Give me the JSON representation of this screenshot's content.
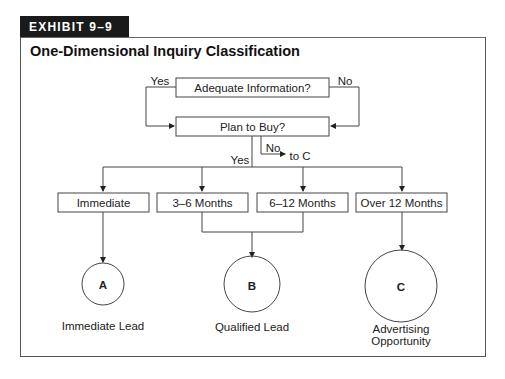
{
  "exhibit": {
    "label": "EXHIBIT 9–9"
  },
  "title": "One-Dimensional Inquiry Classification",
  "nodes": {
    "adequate_info": "Adequate Information?",
    "plan_to_buy": "Plan to Buy?",
    "immediate": "Immediate",
    "months_3_6": "3–6 Months",
    "months_6_12": "6–12 Months",
    "over_12": "Over 12 Months"
  },
  "edges": {
    "adequate_yes": "Yes",
    "adequate_no": "No",
    "plan_no": "No",
    "plan_no_target": "to C",
    "plan_yes": "Yes"
  },
  "outcomes": [
    {
      "letter": "A",
      "label": "Immediate Lead"
    },
    {
      "letter": "B",
      "label": "Qualified Lead"
    },
    {
      "letter": "C",
      "label_line1": "Advertising",
      "label_line2": "Opportunity"
    }
  ]
}
